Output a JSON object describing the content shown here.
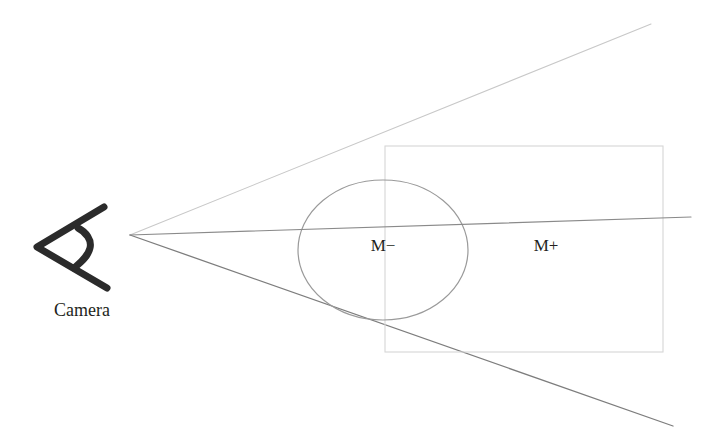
{
  "diagram": {
    "background_color": "#ffffff",
    "camera": {
      "icon_name": "camera-icon",
      "label": "Camera",
      "label_color": "#231f20",
      "icon_color": "#2b2b2b",
      "apex": {
        "x": 130,
        "y": 235
      }
    },
    "labels": {
      "inside_region": "M−",
      "outside_region": "M+",
      "label_color": "#231f20"
    },
    "rays": [
      {
        "name": "upper-frustum-ray",
        "from": {
          "x": 130,
          "y": 235
        },
        "to": {
          "x": 651,
          "y": 24
        },
        "color": "#c8c8c8",
        "width": 1.1
      },
      {
        "name": "center-axis-ray",
        "from": {
          "x": 130,
          "y": 235
        },
        "to": {
          "x": 691,
          "y": 217
        },
        "color": "#8a8a8a",
        "width": 1.2
      },
      {
        "name": "lower-frustum-ray",
        "from": {
          "x": 130,
          "y": 235
        },
        "to": {
          "x": 673,
          "y": 426
        },
        "color": "#7d7d7d",
        "width": 1.3
      }
    ],
    "shapes": {
      "bounding_rectangle": {
        "name": "bounding-rectangle",
        "x": 385,
        "y": 146,
        "width": 278,
        "height": 206,
        "stroke": "#d6d6d6",
        "width_px": 1.1
      },
      "object_ellipse": {
        "name": "object-ellipse",
        "cx": 383,
        "cy": 250,
        "rx": 85,
        "ry": 70,
        "stroke": "#9a9a9a",
        "width_px": 1.2
      }
    },
    "label_positions": {
      "inside_region": {
        "x": 383,
        "y": 251
      },
      "outside_region": {
        "x": 546,
        "y": 251
      },
      "camera": {
        "x": 82,
        "y": 316
      }
    }
  }
}
